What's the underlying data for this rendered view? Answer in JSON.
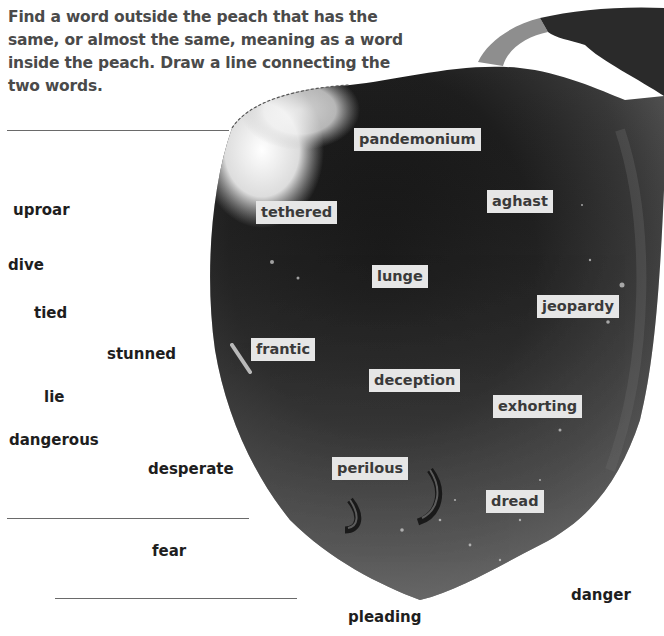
{
  "instructions": "Find a word outside the peach that has the same, or almost the same, meaning as a word inside the peach. Draw a line connecting the two words.",
  "inside_words": [
    {
      "text": "pandemonium",
      "x": 354,
      "y": 128
    },
    {
      "text": "aghast",
      "x": 487,
      "y": 190
    },
    {
      "text": "tethered",
      "x": 256,
      "y": 201
    },
    {
      "text": "lunge",
      "x": 372,
      "y": 265
    },
    {
      "text": "jeopardy",
      "x": 537,
      "y": 295
    },
    {
      "text": "frantic",
      "x": 251,
      "y": 338
    },
    {
      "text": "deception",
      "x": 369,
      "y": 369
    },
    {
      "text": "exhorting",
      "x": 493,
      "y": 395
    },
    {
      "text": "perilous",
      "x": 332,
      "y": 457
    },
    {
      "text": "dread",
      "x": 486,
      "y": 490
    }
  ],
  "outside_words": [
    {
      "text": "uproar",
      "x": 13,
      "y": 201
    },
    {
      "text": "dive",
      "x": 8,
      "y": 256
    },
    {
      "text": "tied",
      "x": 34,
      "y": 304
    },
    {
      "text": "stunned",
      "x": 107,
      "y": 345
    },
    {
      "text": "lie",
      "x": 44,
      "y": 388
    },
    {
      "text": "dangerous",
      "x": 9,
      "y": 431
    },
    {
      "text": "desperate",
      "x": 148,
      "y": 460
    },
    {
      "text": "fear",
      "x": 152,
      "y": 542
    },
    {
      "text": "danger",
      "x": 571,
      "y": 586
    },
    {
      "text": "pleading",
      "x": 348,
      "y": 608
    }
  ],
  "answer_lines": [
    {
      "x": 7,
      "y": 130,
      "width": 222
    },
    {
      "x": 7,
      "y": 518,
      "width": 242
    },
    {
      "x": 55,
      "y": 598,
      "width": 242
    }
  ],
  "copyright": "All rights reserved.",
  "colors": {
    "peach_dark": "#1c1c1c",
    "peach_mid": "#4a4a4a",
    "peach_light": "#8a8a8a",
    "label_bg": "#e6e6e6",
    "text_dark": "#1e1e1e"
  }
}
